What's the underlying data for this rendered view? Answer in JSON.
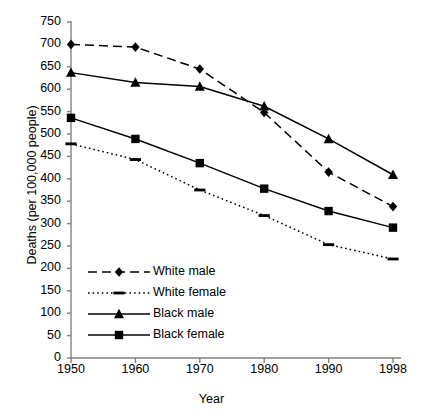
{
  "chart_data": {
    "type": "line",
    "title": "",
    "xlabel": "Year",
    "ylabel": "Deaths (per 100,000 people)",
    "categories": [
      "1950",
      "1960",
      "1970",
      "1980",
      "1990",
      "1998"
    ],
    "x": [
      1950,
      1960,
      1970,
      1980,
      1990,
      1998
    ],
    "ylim": [
      0,
      750
    ],
    "ytick_step": 50,
    "yticks": [
      0,
      50,
      100,
      150,
      200,
      250,
      300,
      350,
      400,
      450,
      500,
      550,
      600,
      650,
      700,
      750
    ],
    "ytick_labels": [
      "0",
      "50",
      "100",
      "150",
      "200",
      "250",
      "300",
      "350",
      "400",
      "450",
      "500",
      "550",
      "600",
      "650",
      "700",
      "750"
    ],
    "grid": false,
    "legend_position": "inside-lower-left",
    "series": [
      {
        "name": "White male",
        "marker": "diamond",
        "linestyle": "dashed",
        "color": "#000000",
        "values": [
          700,
          694,
          645,
          548,
          415,
          338
        ]
      },
      {
        "name": "White female",
        "marker": "dash",
        "linestyle": "dotted",
        "color": "#000000",
        "values": [
          478,
          443,
          375,
          318,
          253,
          221
        ]
      },
      {
        "name": "Black male",
        "marker": "triangle",
        "linestyle": "solid",
        "color": "#000000",
        "values": [
          637,
          615,
          606,
          562,
          489,
          409
        ]
      },
      {
        "name": "Black female",
        "marker": "square",
        "linestyle": "solid",
        "color": "#000000",
        "values": [
          536,
          489,
          435,
          378,
          328,
          291
        ]
      }
    ]
  },
  "legend": {
    "items": [
      {
        "label": "White male"
      },
      {
        "label": "White female"
      },
      {
        "label": "Black male"
      },
      {
        "label": "Black female"
      }
    ]
  },
  "axes": {
    "x_title": "Year",
    "y_title": "Deaths (per 100,000 people)"
  },
  "colors": {
    "axis": "#808080",
    "line": "#000000",
    "background": "#ffffff"
  }
}
